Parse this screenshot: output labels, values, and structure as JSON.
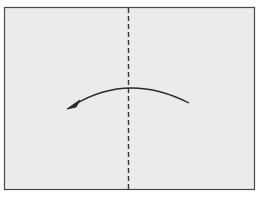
{
  "diagram": {
    "type": "origami-fold-instruction",
    "paper": {
      "shape": "rectangle",
      "fill_color": "#ebebeb",
      "border_color": "#4a4a4a"
    },
    "fold_line": {
      "style": "dashed",
      "orientation": "vertical",
      "position": "center",
      "color": "#333333"
    },
    "arrow": {
      "direction": "right-to-left",
      "shape": "curved-arc",
      "color": "#2a2a2a"
    },
    "colors": {
      "background": "#ffffff",
      "paper": "#ebebeb",
      "border": "#4a4a4a",
      "fold_line": "#333333",
      "arrow": "#2a2a2a"
    }
  }
}
